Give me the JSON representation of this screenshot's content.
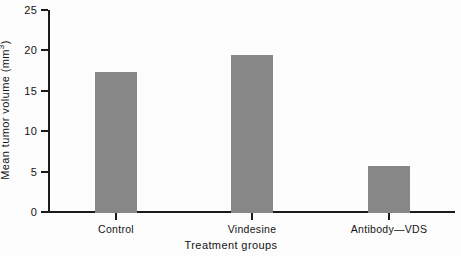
{
  "chart_data": {
    "type": "bar",
    "title": "",
    "subtitle": "",
    "categories": [
      "Control",
      "Vindesine",
      "Antibody—VDS"
    ],
    "values": [
      17.4,
      19.6,
      5.8
    ],
    "series": [
      {
        "name": "Mean tumor volume",
        "values": [
          17.4,
          19.6,
          5.8
        ]
      }
    ],
    "xlabel": "Treatment groups",
    "ylabel": "Mean tumor volume (mm³)",
    "ylabel_base": "Mean tumor volume (mm",
    "ylabel_sup": "3",
    "ylabel_tail": ")",
    "ylim": [
      0,
      25
    ],
    "ytick_values": [
      0,
      5,
      10,
      15,
      20,
      25
    ],
    "ytick_labels": [
      "0",
      "5",
      "10",
      "15",
      "20",
      "25"
    ],
    "grid": false,
    "legend": false,
    "legend_position": "none",
    "bar_color": "#878787",
    "axis_color": "#1b1b1b",
    "background_color": "#fdfdfd"
  }
}
